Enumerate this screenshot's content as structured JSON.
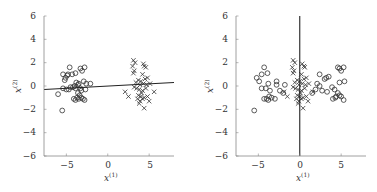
{
  "chart_data": [
    {
      "type": "scatter",
      "title": "",
      "xlabel": "x(1)",
      "ylabel": "x(2)",
      "xlim": [
        -7.7,
        8
      ],
      "ylim": [
        -6,
        6
      ],
      "xticks": [
        -5,
        0,
        5
      ],
      "yticks": [
        -6,
        -4,
        -2,
        0,
        2,
        4,
        6
      ],
      "grid": false,
      "legend": null,
      "series": [
        {
          "name": "class-circle",
          "marker": "o",
          "points": [
            [
              -5.5,
              -2.1
            ],
            [
              -6.0,
              -0.7
            ],
            [
              -5.4,
              1.0
            ],
            [
              -5.1,
              0.7
            ],
            [
              -4.9,
              0.9
            ],
            [
              -4.6,
              1.6
            ],
            [
              -4.8,
              1.0
            ],
            [
              -4.3,
              1.0
            ],
            [
              -3.9,
              1.1
            ],
            [
              -5.2,
              0.5
            ],
            [
              -5.0,
              -0.3
            ],
            [
              -5.4,
              -0.2
            ],
            [
              -4.7,
              -0.3
            ],
            [
              -4.5,
              -0.1
            ],
            [
              -4.2,
              -0.1
            ],
            [
              -3.9,
              -0.2
            ],
            [
              -3.8,
              0.3
            ],
            [
              -3.5,
              0.2
            ],
            [
              -3.3,
              1.5
            ],
            [
              -3.1,
              1.3
            ],
            [
              -2.8,
              1.6
            ],
            [
              -2.9,
              0.4
            ],
            [
              -2.6,
              0.2
            ],
            [
              -2.7,
              -0.3
            ],
            [
              -2.1,
              0.2
            ],
            [
              -3.2,
              -0.4
            ],
            [
              -3.6,
              -0.6
            ],
            [
              -3.4,
              -0.8
            ],
            [
              -3.7,
              -1.0
            ],
            [
              -4.1,
              -1.1
            ],
            [
              -3.9,
              -1.2
            ],
            [
              -3.5,
              -1.1
            ],
            [
              -3.2,
              -1.0
            ],
            [
              -3.0,
              -1.1
            ],
            [
              -2.8,
              -1.2
            ],
            [
              -3.3,
              -0.2
            ],
            [
              -4.0,
              0.0
            ],
            [
              -3.6,
              0.1
            ]
          ]
        },
        {
          "name": "class-cross",
          "marker": "x",
          "points": [
            [
              3.1,
              2.2
            ],
            [
              3.3,
              2.0
            ],
            [
              3.0,
              1.7
            ],
            [
              3.2,
              1.3
            ],
            [
              3.1,
              1.1
            ],
            [
              4.3,
              1.9
            ],
            [
              4.4,
              1.7
            ],
            [
              4.6,
              1.6
            ],
            [
              4.2,
              1.0
            ],
            [
              4.5,
              0.6
            ],
            [
              4.8,
              0.7
            ],
            [
              4.0,
              0.4
            ],
            [
              3.7,
              0.5
            ],
            [
              3.9,
              0.1
            ],
            [
              4.3,
              0.2
            ],
            [
              4.7,
              0.1
            ],
            [
              5.1,
              0.2
            ],
            [
              3.2,
              -0.1
            ],
            [
              3.5,
              -0.2
            ],
            [
              3.8,
              -0.3
            ],
            [
              4.2,
              -0.4
            ],
            [
              4.6,
              -0.2
            ],
            [
              5.6,
              -0.5
            ],
            [
              2.1,
              -0.5
            ],
            [
              2.5,
              -0.9
            ],
            [
              3.7,
              -0.8
            ],
            [
              4.0,
              -0.9
            ],
            [
              3.6,
              -1.1
            ],
            [
              3.9,
              -1.3
            ],
            [
              4.2,
              -1.1
            ],
            [
              4.4,
              -1.0
            ],
            [
              4.8,
              -0.9
            ],
            [
              5.0,
              -1.3
            ],
            [
              3.8,
              -1.5
            ],
            [
              4.4,
              -1.9
            ],
            [
              4.1,
              -0.6
            ],
            [
              3.4,
              0.3
            ]
          ]
        }
      ],
      "lines": [
        {
          "name": "decision-boundary",
          "x": [
            -7.7,
            8
          ],
          "y": [
            -0.3,
            0.3
          ]
        }
      ]
    },
    {
      "type": "scatter",
      "title": "",
      "xlabel": "x(1)",
      "ylabel": "x(2)",
      "xlim": [
        -7.7,
        8
      ],
      "ylim": [
        -6,
        6
      ],
      "xticks": [
        -5,
        0,
        5
      ],
      "yticks": [
        -6,
        -4,
        -2,
        0,
        2,
        4,
        6
      ],
      "grid": false,
      "legend": null,
      "series": [
        {
          "name": "class-circle",
          "marker": "o",
          "points": [
            [
              -5.5,
              -2.1
            ],
            [
              -5.2,
              0.7
            ],
            [
              -4.9,
              0.4
            ],
            [
              -4.6,
              1.0
            ],
            [
              -4.3,
              1.6
            ],
            [
              -3.9,
              1.1
            ],
            [
              -4.6,
              -0.2
            ],
            [
              -4.1,
              -0.2
            ],
            [
              -3.8,
              0.2
            ],
            [
              -3.6,
              -0.4
            ],
            [
              -4.3,
              -1.1
            ],
            [
              -4.0,
              -1.1
            ],
            [
              -3.8,
              -1.2
            ],
            [
              -3.4,
              -1.0
            ],
            [
              -3.0,
              -1.1
            ],
            [
              -2.8,
              0.4
            ],
            [
              -2.8,
              0.1
            ],
            [
              -2.4,
              -0.4
            ],
            [
              -1.8,
              0.1
            ],
            [
              -2.0,
              -0.6
            ],
            [
              -3.7,
              -0.9
            ],
            [
              5.3,
              1.6
            ],
            [
              4.8,
              1.5
            ],
            [
              5.0,
              1.3
            ],
            [
              4.6,
              1.6
            ],
            [
              5.4,
              0.4
            ],
            [
              4.8,
              0.3
            ],
            [
              2.4,
              1.0
            ],
            [
              3.0,
              0.6
            ],
            [
              3.5,
              0.8
            ],
            [
              3.2,
              0.7
            ],
            [
              2.4,
              0.0
            ],
            [
              2.7,
              -0.4
            ],
            [
              3.3,
              -0.5
            ],
            [
              3.9,
              -0.1
            ],
            [
              4.2,
              -0.3
            ],
            [
              4.6,
              -0.6
            ],
            [
              4.8,
              -0.8
            ],
            [
              4.3,
              -1.0
            ],
            [
              4.0,
              -1.1
            ],
            [
              4.4,
              -0.9
            ],
            [
              5.0,
              -0.9
            ],
            [
              5.3,
              -1.2
            ],
            [
              1.5,
              -0.6
            ],
            [
              1.9,
              -0.3
            ],
            [
              2.1,
              0.2
            ]
          ]
        },
        {
          "name": "class-cross",
          "marker": "x",
          "points": [
            [
              -0.8,
              2.2
            ],
            [
              -0.6,
              2.0
            ],
            [
              -0.9,
              1.6
            ],
            [
              -0.7,
              1.3
            ],
            [
              -0.8,
              1.1
            ],
            [
              0.3,
              1.9
            ],
            [
              0.5,
              1.7
            ],
            [
              0.6,
              1.6
            ],
            [
              0.2,
              1.0
            ],
            [
              0.5,
              0.6
            ],
            [
              0.8,
              0.7
            ],
            [
              0.0,
              0.4
            ],
            [
              -0.3,
              0.5
            ],
            [
              -0.1,
              0.1
            ],
            [
              0.3,
              0.2
            ],
            [
              0.7,
              0.1
            ],
            [
              1.1,
              0.2
            ],
            [
              -0.8,
              -0.1
            ],
            [
              -0.5,
              -0.2
            ],
            [
              -0.2,
              -0.3
            ],
            [
              0.2,
              -0.4
            ],
            [
              0.6,
              -0.2
            ],
            [
              1.6,
              -0.5
            ],
            [
              -1.9,
              -0.5
            ],
            [
              -1.5,
              -0.9
            ],
            [
              -0.3,
              -0.8
            ],
            [
              0.0,
              -0.9
            ],
            [
              -0.4,
              -1.1
            ],
            [
              -0.1,
              -1.3
            ],
            [
              0.2,
              -1.1
            ],
            [
              0.4,
              -1.0
            ],
            [
              0.8,
              -0.9
            ],
            [
              1.0,
              -1.3
            ],
            [
              -0.2,
              -1.5
            ],
            [
              0.4,
              -1.9
            ],
            [
              0.1,
              -0.6
            ],
            [
              -0.6,
              0.3
            ]
          ]
        }
      ],
      "lines": [
        {
          "name": "decision-boundary",
          "x": [
            0,
            0
          ],
          "y": [
            -6,
            6
          ]
        }
      ]
    }
  ],
  "plots": [
    {
      "yticks": [
        "6",
        "4",
        "2",
        "0",
        "−2",
        "−4",
        "−6"
      ],
      "xticks": [
        "−5",
        "0",
        "5"
      ],
      "xlabel_main": "x",
      "xlabel_sup": "(1)",
      "ylabel_main": "x",
      "ylabel_sup": "(2)"
    },
    {
      "yticks": [
        "6",
        "4",
        "2",
        "0",
        "−2",
        "−4",
        "−6"
      ],
      "xticks": [
        "−5",
        "0",
        "5"
      ],
      "xlabel_main": "x",
      "xlabel_sup": "(1)",
      "ylabel_main": "x",
      "ylabel_sup": "(2)"
    }
  ],
  "colors": {
    "axis": "#888888",
    "marker": "#333333",
    "line": "#222222"
  }
}
